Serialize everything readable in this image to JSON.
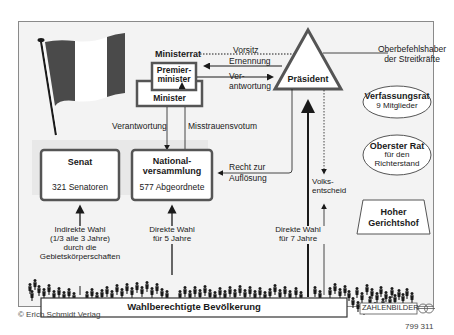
{
  "diagram": {
    "nodes": {
      "ministerrat": "Ministerrat",
      "premierminister_line1": "Premier-",
      "premierminister_line2": "minister",
      "minister": "Minister",
      "praesident": "Präsident",
      "senat_title": "Senat",
      "senat_members": "321 Senatoren",
      "nationalversammlung_line1": "National-",
      "nationalversammlung_line2": "versammlung",
      "nationalversammlung_members": "577 Abgeordnete",
      "verfassungsrat_title": "Verfassungsrat",
      "verfassungsrat_members": "9 Mitglieder",
      "oberster_rat_title": "Oberster Rat",
      "oberster_rat_line2": "für den",
      "oberster_rat_line3": "Richterstand",
      "hoher_gerichtshof_line1": "Hoher",
      "hoher_gerichtshof_line2": "Gerichtshof",
      "bevoelkerung": "Wahlberechtigte Bevölkerung"
    },
    "edges": {
      "vorsitz": "Vorsitz",
      "ernennung": "Ernennung",
      "verantwortung_pres_line1": "Ver-",
      "verantwortung_pres_line2": "antwortung",
      "oberbefehlshaber_line1": "Oberbefehlshaber",
      "oberbefehlshaber_line2": "der Streitkräfte",
      "verantwortung": "Verantwortung",
      "misstrauensvotum": "Misstrauensvotum",
      "recht_zur": "Recht zur",
      "aufloesung": "Auflösung",
      "volksentscheid_line1": "Volks-",
      "volksentscheid_line2": "entscheid",
      "indirekte_wahl_line1": "Indirekte Wahl",
      "indirekte_wahl_line2": "(1/3 alle 3 Jahre)",
      "indirekte_wahl_line3": "durch die",
      "indirekte_wahl_line4": "Gebietskörperschaften",
      "direkte_wahl_5_line1": "Direkte Wahl",
      "direkte_wahl_5_line2": "für 5 Jahre",
      "direkte_wahl_7_line1": "Direkte Wahl",
      "direkte_wahl_7_line2": "für 7 Jahre"
    }
  },
  "footer": {
    "copyright": "© Erich Schmidt Verlag",
    "brand": "ZAHLENBILDER",
    "number": "799 311"
  },
  "colors": {
    "frame_bg": "#f3f3f3",
    "panel_bg": "#e8e8e8",
    "box_border": "#555555",
    "flag_dark": "#4a4a4a",
    "text": "#1a1a1a"
  }
}
